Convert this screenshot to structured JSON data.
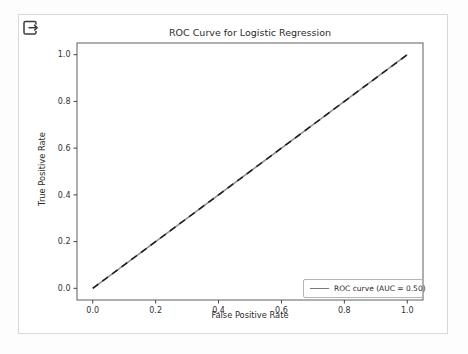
{
  "icons": {
    "top_left": "box-arrow-right"
  },
  "colors": {
    "background": "#ffffff",
    "card_border": "#d8d8d8",
    "spine": "#5f5f5f",
    "tick": "#444444",
    "text": "#2b2b2b",
    "legend_border": "#b5b5b5",
    "roc_line_solid": "#8f8f8f",
    "roc_line_dash": "#1c1c1c"
  },
  "chart_data": {
    "type": "line",
    "title": "ROC Curve for Logistic Regression",
    "xlabel": "False Positive Rate",
    "ylabel": "True Positive Rate",
    "xlim": [
      -0.05,
      1.05
    ],
    "ylim": [
      -0.05,
      1.05
    ],
    "xticks": [
      0.0,
      0.2,
      0.4,
      0.6,
      0.8,
      1.0
    ],
    "yticks": [
      0.0,
      0.2,
      0.4,
      0.6,
      0.8,
      1.0
    ],
    "grid": false,
    "legend": {
      "position": "lower right",
      "entries": [
        "ROC curve (AUC = 0.50)"
      ]
    },
    "series": [
      {
        "name": "ROC curve",
        "x": [
          0.0,
          1.0
        ],
        "y": [
          0.0,
          1.0
        ],
        "line_style": "solid",
        "color": "#8f8f8f",
        "width": 1.6
      },
      {
        "name": "chance diagonal",
        "x": [
          0.0,
          1.0
        ],
        "y": [
          0.0,
          1.0
        ],
        "line_style": "dashed",
        "color": "#1c1c1c",
        "width": 1.5
      }
    ]
  }
}
